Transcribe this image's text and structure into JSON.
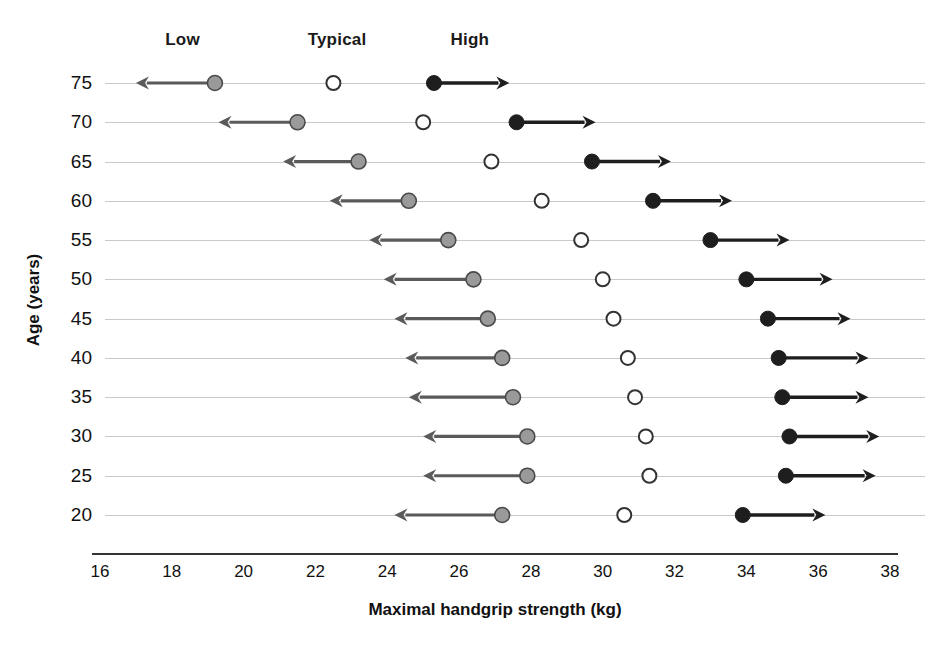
{
  "chart_data": {
    "type": "scatter",
    "title": "",
    "xlabel": "Maximal handgrip strength (kg)",
    "ylabel": "Age (years)",
    "xlim": [
      16,
      38
    ],
    "xticks": [
      16,
      18,
      20,
      22,
      24,
      26,
      28,
      30,
      32,
      34,
      36,
      38
    ],
    "yticks": [
      75,
      70,
      65,
      60,
      55,
      50,
      45,
      40,
      35,
      30,
      25,
      20
    ],
    "grid": true,
    "legend_position": "top",
    "series": [
      {
        "name": "Low",
        "marker": "filled-gray-circle",
        "color": "#9a9a9a",
        "arrow_direction": "left",
        "values": [
          19.2,
          21.5,
          23.2,
          24.6,
          25.7,
          26.4,
          26.8,
          27.2,
          27.5,
          27.9,
          27.9,
          27.2
        ]
      },
      {
        "name": "Typical",
        "marker": "open-circle",
        "color": "#ffffff",
        "arrow_direction": "none",
        "values": [
          22.5,
          25.0,
          26.9,
          28.3,
          29.4,
          30.0,
          30.3,
          30.7,
          30.9,
          31.2,
          31.3,
          30.6
        ]
      },
      {
        "name": "High",
        "marker": "filled-black-circle",
        "color": "#1e1e1e",
        "arrow_direction": "right",
        "values": [
          25.3,
          27.6,
          29.7,
          31.4,
          33.0,
          34.0,
          34.6,
          34.9,
          35.0,
          35.2,
          35.1,
          33.9
        ]
      }
    ],
    "arrow_tips": {
      "Low": [
        17.0,
        19.3,
        21.1,
        22.4,
        23.5,
        23.9,
        24.2,
        24.5,
        24.6,
        25.0,
        25.0,
        24.2
      ],
      "High": [
        27.4,
        29.8,
        31.9,
        33.6,
        35.2,
        36.4,
        36.9,
        37.4,
        37.4,
        37.7,
        37.6,
        36.2
      ]
    }
  },
  "legend": {
    "items": [
      {
        "label": "Low",
        "x_value": 18.3
      },
      {
        "label": "Typical",
        "x_value": 22.6
      },
      {
        "label": "High",
        "x_value": 26.3
      }
    ]
  },
  "axes": {
    "y_title": "Age (years)",
    "x_title": "Maximal handgrip strength (kg)",
    "y_tick_labels": [
      "75",
      "70",
      "65",
      "60",
      "55",
      "50",
      "45",
      "40",
      "35",
      "30",
      "25",
      "20"
    ],
    "x_tick_labels": [
      "16",
      "18",
      "20",
      "22",
      "24",
      "26",
      "28",
      "30",
      "32",
      "34",
      "36",
      "38"
    ]
  },
  "style": {
    "low_color": "#9a9a9a",
    "low_edge": "#4a4a4a",
    "typical_fill": "#ffffff",
    "typical_edge": "#333333",
    "high_color": "#1e1e1e",
    "grid_color": "#c9c9c9",
    "axis_color": "#333333",
    "text_color": "#111111"
  }
}
